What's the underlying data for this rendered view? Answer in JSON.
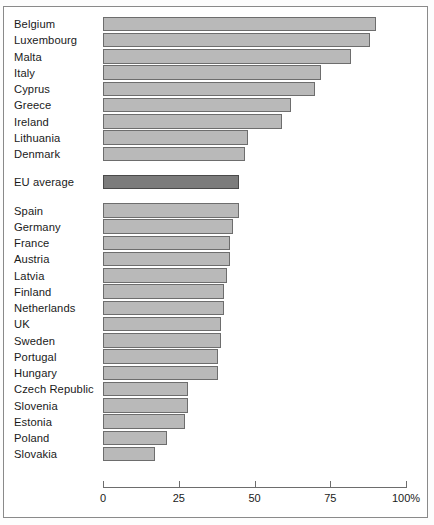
{
  "chart_data": {
    "type": "bar",
    "orientation": "horizontal",
    "title": "",
    "xlabel": "",
    "ylabel": "",
    "xlim": [
      0,
      100
    ],
    "grid": false,
    "legend": false,
    "axis_suffix": "%",
    "tick_values": [
      0,
      25,
      50,
      75,
      100
    ],
    "tick_labels": [
      "0",
      "25",
      "50",
      "75",
      "100%"
    ],
    "categories": [
      "Belgium",
      "Luxembourg",
      "Malta",
      "Italy",
      "Cyprus",
      "Greece",
      "Ireland",
      "Lithuania",
      "Denmark",
      "EU average",
      "Spain",
      "Germany",
      "France",
      "Austria",
      "Latvia",
      "Finland",
      "Netherlands",
      "UK",
      "Sweden",
      "Portugal",
      "Hungary",
      "Czech Republic",
      "Slovenia",
      "Estonia",
      "Poland",
      "Slovakia"
    ],
    "values": [
      90,
      88,
      82,
      72,
      70,
      62,
      59,
      48,
      47,
      45,
      45,
      43,
      42,
      42,
      41,
      40,
      40,
      39,
      39,
      38,
      38,
      28,
      28,
      27,
      21,
      17
    ],
    "highlight_index": 9,
    "colors": {
      "bar_fill": "#b9b9b9",
      "bar_stroke": "#6d6d6d",
      "highlight_fill": "#7c7c7c",
      "highlight_stroke": "#4a4a4a",
      "text": "#1a1a1a",
      "frame": "#8a8a8a",
      "background": "#ffffff"
    },
    "group_gaps_after": [
      8,
      9
    ]
  }
}
